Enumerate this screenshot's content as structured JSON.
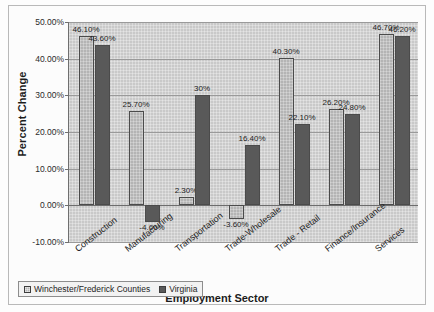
{
  "figure": {
    "y_axis_title": "Percent Change",
    "x_axis_title": "Employment Sector"
  },
  "legend": {
    "entries": [
      {
        "label": "Winchester/Frederick Counties",
        "color": "#b4b4b4"
      },
      {
        "label": "Virginia",
        "color": "#595959"
      }
    ]
  },
  "chart_data": {
    "type": "bar",
    "title": "",
    "xlabel": "Employment Sector",
    "ylabel": "Percent Change",
    "ylim": [
      -10,
      50
    ],
    "yticks": [
      50,
      40,
      30,
      20,
      10,
      0,
      -10
    ],
    "ytick_labels": [
      "50.00%",
      "40.00%",
      "30.00%",
      "20.00%",
      "10.00%",
      "0.00%",
      "-10.00%"
    ],
    "grid": true,
    "legend_position": "bottom-left",
    "categories": [
      "Construction",
      "Manufacturing",
      "Transportation",
      "Trade-Wholesale",
      "Trade - Retail",
      "Finance/Insurance",
      "Services"
    ],
    "series": [
      {
        "name": "Winchester/Frederick Counties",
        "color": "#b4b4b4",
        "values": [
          46.1,
          25.7,
          2.3,
          -3.6,
          40.3,
          26.2,
          46.7
        ],
        "labels": [
          "46.10%",
          "25.70%",
          "2.30%",
          "-3.60%",
          "40.30%",
          "26.20%",
          "46.70%"
        ]
      },
      {
        "name": "Virginia",
        "color": "#595959",
        "values": [
          43.6,
          -4.6,
          30.0,
          16.4,
          22.1,
          24.8,
          46.2
        ],
        "labels": [
          "43.60%",
          "-4.60%",
          "30%",
          "16.40%",
          "22.10%",
          "24.80%",
          "46.20%"
        ]
      }
    ]
  }
}
